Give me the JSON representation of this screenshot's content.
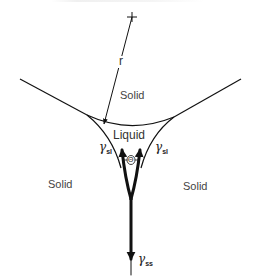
{
  "figure": {
    "labels": {
      "solid_top": "Solid",
      "solid_left": "Solid",
      "solid_right": "Solid",
      "liquid": "Liquid",
      "radius": "r",
      "theta": "Θ",
      "gamma_sl_left": "γ",
      "gamma_sl_left_sub": "sl",
      "gamma_sl_right": "γ",
      "gamma_sl_right_sub": "sl",
      "gamma_ss": "γ",
      "gamma_ss_sub": "ss"
    },
    "colors": {
      "line": "#111111",
      "text": "#444444"
    }
  }
}
